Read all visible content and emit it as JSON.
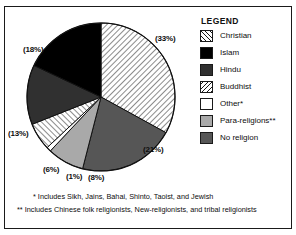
{
  "figure": {
    "top_sliver_text": "",
    "legend_title": "LEGEND"
  },
  "legend": {
    "items": [
      {
        "label": "Christian",
        "fill": "forward-hatch",
        "color": "#ffffff"
      },
      {
        "label": "Islam",
        "fill": "solid",
        "color": "#000000"
      },
      {
        "label": "Hindu",
        "fill": "solid",
        "color": "#303030"
      },
      {
        "label": "Buddhist",
        "fill": "backward-hatch",
        "color": "#ffffff"
      },
      {
        "label": "Other*",
        "fill": "solid",
        "color": "#ffffff"
      },
      {
        "label": "Para-religions**",
        "fill": "solid",
        "color": "#a9a9a9"
      },
      {
        "label": "No religion",
        "fill": "solid",
        "color": "#565656"
      }
    ]
  },
  "footnotes": [
    "* Includes Sikh, Jains, Bahai, Shinto, Taoist, and Jewish",
    "** Includes Chinese folk religionists, New-religionists, and tribal religionists"
  ],
  "pie_labels": [
    {
      "text": "(33%)",
      "left": 150,
      "top": 27
    },
    {
      "text": "(18%)",
      "left": 18,
      "top": 38
    },
    {
      "text": "(13%)",
      "left": 3,
      "top": 122
    },
    {
      "text": "(6%)",
      "left": 38,
      "top": 158
    },
    {
      "text": "(1%)",
      "left": 61,
      "top": 165
    },
    {
      "text": "(8%)",
      "left": 83,
      "top": 166
    },
    {
      "text": "(21%)",
      "left": 138,
      "top": 138
    }
  ],
  "chart_data": {
    "type": "pie",
    "title": "",
    "xlabel": "",
    "ylabel": "",
    "units": "percent",
    "start_angle_deg": 0,
    "direction": "clockwise",
    "categories": [
      "Christian",
      "No religion",
      "Para-religions**",
      "Other*",
      "Buddhist",
      "Hindu",
      "Islam"
    ],
    "values": [
      33,
      21,
      8,
      1,
      6,
      13,
      18
    ],
    "labels": [
      "(33%)",
      "(21%)",
      "(8%)",
      "(1%)",
      "(6%)",
      "(13%)",
      "(18%)"
    ],
    "colors": [
      "#ffffff",
      "#565656",
      "#a9a9a9",
      "#ffffff",
      "#ffffff",
      "#303030",
      "#000000"
    ],
    "patterns": [
      "forward-hatch",
      "solid",
      "solid",
      "solid",
      "backward-hatch",
      "solid",
      "solid"
    ],
    "legend_position": "right",
    "grid": false,
    "total": 100
  }
}
